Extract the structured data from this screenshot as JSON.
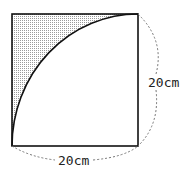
{
  "figure": {
    "side_label_right": "20cm",
    "side_label_bottom": "20cm",
    "colors": {
      "stroke": "#111111",
      "shade_dot": "#888888",
      "dashed": "#777777",
      "background": "#ffffff"
    }
  }
}
